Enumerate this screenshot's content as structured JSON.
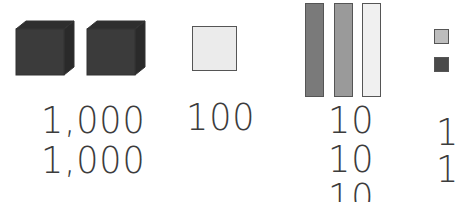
{
  "colors": {
    "cube": "#3b3b3b",
    "flat": "#ebebeb",
    "rod_dark": "#7a7a7a",
    "rod_medium": "#9a9a9a",
    "rod_light": "#f0f0f0",
    "unit_light": "#bdbdbd",
    "unit_dark": "#4a4a4a",
    "outline": "#555555",
    "text": "#3c3c3c"
  },
  "blocks": {
    "thousands": {
      "icon": "cube-icon",
      "count": 2
    },
    "hundreds": {
      "icon": "flat-square-icon",
      "count": 1
    },
    "tens": {
      "icon": "rod-icon",
      "count": 3
    },
    "ones": {
      "icon": "unit-square-icon",
      "count": 2
    }
  },
  "labels": {
    "thousands": [
      "1,000",
      "1,000"
    ],
    "hundreds": [
      "100"
    ],
    "tens": [
      "10",
      "10",
      "10"
    ],
    "ones": [
      "1",
      "1"
    ]
  }
}
